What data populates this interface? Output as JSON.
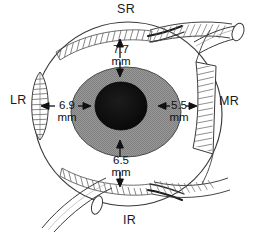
{
  "figure": {
    "type": "anatomical-diagram"
  },
  "colors": {
    "background": "#ffffff",
    "outline": "#3a3a3a",
    "iris_fill": "#8e8e8e",
    "pupil_fill": "#0d0d0d",
    "text": "#111111",
    "hatch": "#5a5a5a"
  },
  "muscles": [
    {
      "id": "sr",
      "abbr": "SR",
      "name": "superior rectus",
      "position": "top",
      "label_x": 117,
      "label_y": 3
    },
    {
      "id": "lr",
      "abbr": "LR",
      "name": "lateral rectus",
      "position": "left",
      "label_x": 10,
      "label_y": 94
    },
    {
      "id": "mr",
      "abbr": "MR",
      "name": "medial rectus",
      "position": "right",
      "label_x": 219,
      "label_y": 95
    },
    {
      "id": "ir",
      "abbr": "IR",
      "name": "inferior rectus",
      "position": "bottom",
      "label_x": 123,
      "label_y": 214
    }
  ],
  "measurements": [
    {
      "id": "sr-distance",
      "muscle": "SR",
      "value": "7.7",
      "unit": "mm",
      "orientation": "vertical",
      "x": 114,
      "y": 44
    },
    {
      "id": "lr-distance",
      "muscle": "LR",
      "value": "6.9",
      "unit": "mm",
      "orientation": "horizontal",
      "x": 50,
      "y": 101
    },
    {
      "id": "mr-distance",
      "muscle": "MR",
      "value": "5.5",
      "unit": "mm",
      "orientation": "horizontal",
      "x": 163,
      "y": 101
    },
    {
      "id": "ir-distance",
      "muscle": "IR",
      "value": "6.5",
      "unit": "mm",
      "orientation": "vertical",
      "x": 114,
      "y": 158
    }
  ]
}
